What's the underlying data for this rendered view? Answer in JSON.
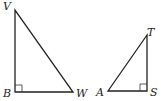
{
  "diagram": {
    "triangles": [
      {
        "name": "VBW",
        "vertices": [
          {
            "label": "V",
            "x": 15,
            "y": 10
          },
          {
            "label": "B",
            "x": 15,
            "y": 92
          },
          {
            "label": "W",
            "x": 73,
            "y": 92
          }
        ],
        "right_angle_at": "B"
      },
      {
        "name": "TAS",
        "vertices": [
          {
            "label": "T",
            "x": 147,
            "y": 35
          },
          {
            "label": "A",
            "x": 108,
            "y": 91
          },
          {
            "label": "S",
            "x": 147,
            "y": 91
          }
        ],
        "right_angle_at": "S"
      }
    ],
    "labels": {
      "V": "V",
      "B": "B",
      "W": "W",
      "T": "T",
      "A": "A",
      "S": "S"
    }
  }
}
